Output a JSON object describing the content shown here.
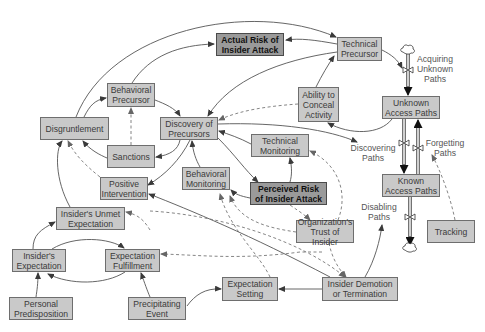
{
  "diagram": {
    "type": "system-dynamics-stock-flow",
    "nodes": {
      "actual_risk": "Actual Risk of\nInsider Attack",
      "technical_precursor": "Technical\nPrecursor",
      "behavioral_precursor": "Behavioral\nPrecursor",
      "disgruntlement": "Disgruntlement",
      "discovery_of_precursors": "Discovery of\nPrecursors",
      "sanctions": "Sanctions",
      "ability_to_conceal": "Ability to\nConceal\nActivity",
      "unknown_access_paths": "Unknown\nAccess Paths",
      "technical_monitoring": "Technical\nMonitoring",
      "positive_intervention": "Positive\nIntervention",
      "behavioral_monitoring": "Behavioral\nMonitoring",
      "perceived_risk": "Perceived Risk\nof Insider Attack",
      "known_access_paths": "Known\nAccess Paths",
      "unmet_expectation": "Insider's Unmet\nExpectation",
      "org_trust": "Organization's\nTrust of Insider",
      "tracking": "Tracking",
      "insider_expectation": "Insider's\nExpectation",
      "expectation_fulfillment": "Expectation\nFulfillment",
      "expectation_setting": "Expectation\nSetting",
      "demotion_termination": "Insider Demotion\nor Termination",
      "personal_predisposition": "Personal\nPredisposition",
      "precipitating_event": "Precipitating\nEvent"
    },
    "flow_labels": {
      "acquiring": "Acquiring\nUnknown\nPaths",
      "discovering": "Discovering\nPaths",
      "forgetting": "Forgetting\nPaths",
      "disabling": "Disabling\nPaths"
    },
    "colors": {
      "node_fill": "#c9c9c9",
      "node_border": "#6e6e6e",
      "highlight_fill": "#9a9a9a",
      "edge": "#4a4a4a",
      "dashed_edge": "#777777"
    }
  }
}
